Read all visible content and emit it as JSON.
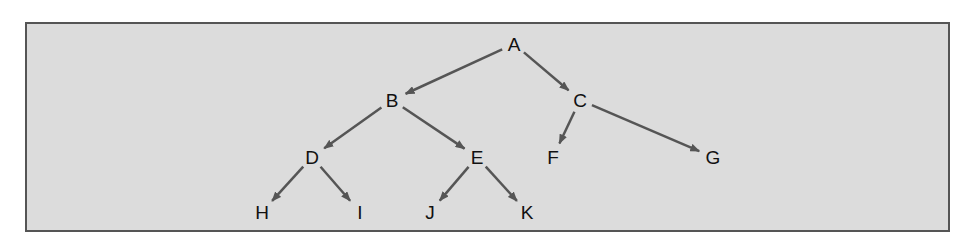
{
  "diagram": {
    "type": "binary-tree",
    "colors": {
      "background": "#dcdcdc",
      "border": "#555555",
      "edge": "#555555",
      "text": "#111111"
    },
    "nodes": [
      {
        "id": "A",
        "label": "A",
        "x": 514,
        "y": 44
      },
      {
        "id": "B",
        "label": "B",
        "x": 392,
        "y": 100
      },
      {
        "id": "C",
        "label": "C",
        "x": 580,
        "y": 100
      },
      {
        "id": "D",
        "label": "D",
        "x": 312,
        "y": 157
      },
      {
        "id": "E",
        "label": "E",
        "x": 477,
        "y": 157
      },
      {
        "id": "F",
        "label": "F",
        "x": 553,
        "y": 157
      },
      {
        "id": "G",
        "label": "G",
        "x": 713,
        "y": 157
      },
      {
        "id": "H",
        "label": "H",
        "x": 262,
        "y": 212
      },
      {
        "id": "I",
        "label": "I",
        "x": 360,
        "y": 212
      },
      {
        "id": "J",
        "label": "J",
        "x": 430,
        "y": 212
      },
      {
        "id": "K",
        "label": "K",
        "x": 527,
        "y": 212
      }
    ],
    "edges": [
      {
        "from": "A",
        "to": "B"
      },
      {
        "from": "A",
        "to": "C"
      },
      {
        "from": "B",
        "to": "D"
      },
      {
        "from": "B",
        "to": "E"
      },
      {
        "from": "C",
        "to": "F"
      },
      {
        "from": "C",
        "to": "G"
      },
      {
        "from": "D",
        "to": "H"
      },
      {
        "from": "D",
        "to": "I"
      },
      {
        "from": "E",
        "to": "J"
      },
      {
        "from": "E",
        "to": "K"
      }
    ]
  }
}
